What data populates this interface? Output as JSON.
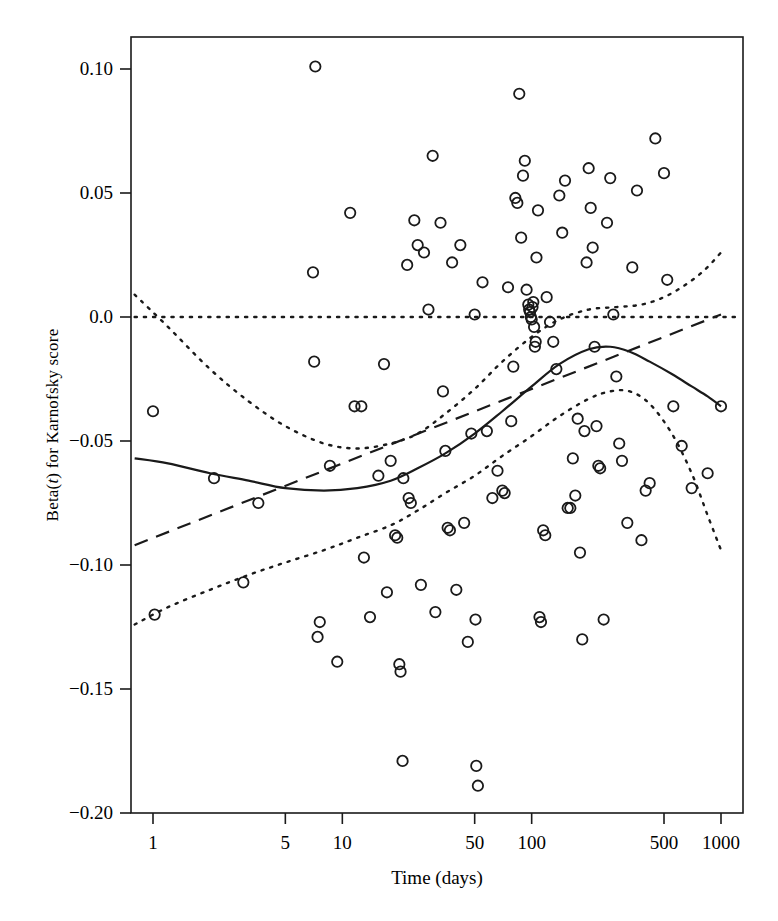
{
  "chart_data": {
    "type": "scatter",
    "title": "",
    "xlabel": "Time (days)",
    "ylabel": "Beta(t) for Karnofsky score",
    "ylabel_parts": {
      "pre": "Beta(",
      "italic": "t",
      "post": ") for Karnofsky score"
    },
    "x_scale": "log",
    "xlim": [
      0.76,
      1250
    ],
    "ylim": [
      -0.2,
      0.1135
    ],
    "xticks": [
      1,
      5,
      10,
      50,
      100,
      500,
      1000
    ],
    "xtick_labels": [
      "1",
      "5",
      "10",
      "50",
      "100",
      "500",
      "1000"
    ],
    "yticks": [
      0.1,
      0.05,
      0.0,
      -0.05,
      -0.1,
      -0.15,
      -0.2
    ],
    "ytick_labels": [
      "0.10",
      "0.05",
      "0.0",
      "-0.05",
      "-0.10",
      "-0.15",
      "-0.20"
    ],
    "grid": false,
    "legend": null,
    "frame": true,
    "marker": "open-circle",
    "marker_color": "#1a1a1a",
    "points": [
      [
        1.0,
        -0.038
      ],
      [
        1.02,
        -0.12
      ],
      [
        2.1,
        -0.065
      ],
      [
        3.0,
        -0.107
      ],
      [
        3.6,
        -0.075
      ],
      [
        7.2,
        0.101
      ],
      [
        7.0,
        0.018
      ],
      [
        7.1,
        -0.018
      ],
      [
        7.4,
        -0.129
      ],
      [
        7.6,
        -0.123
      ],
      [
        8.6,
        -0.06
      ],
      [
        9.4,
        -0.139
      ],
      [
        11.0,
        0.042
      ],
      [
        11.6,
        -0.036
      ],
      [
        12.6,
        -0.036
      ],
      [
        13.0,
        -0.097
      ],
      [
        14.0,
        -0.121
      ],
      [
        15.5,
        -0.064
      ],
      [
        16.6,
        -0.019
      ],
      [
        17.2,
        -0.111
      ],
      [
        18.0,
        -0.058
      ],
      [
        19.0,
        -0.088
      ],
      [
        19.5,
        -0.089
      ],
      [
        20.0,
        -0.14
      ],
      [
        20.3,
        -0.143
      ],
      [
        20.8,
        -0.179
      ],
      [
        21.0,
        -0.065
      ],
      [
        22.0,
        0.021
      ],
      [
        22.4,
        -0.073
      ],
      [
        23.0,
        -0.075
      ],
      [
        24.0,
        0.039
      ],
      [
        25.0,
        0.029
      ],
      [
        26.0,
        -0.108
      ],
      [
        27.0,
        0.026
      ],
      [
        28.5,
        0.003
      ],
      [
        30.0,
        0.065
      ],
      [
        31.0,
        -0.119
      ],
      [
        33.0,
        0.038
      ],
      [
        34.0,
        -0.03
      ],
      [
        35.0,
        -0.054
      ],
      [
        36.0,
        -0.085
      ],
      [
        37.0,
        -0.086
      ],
      [
        38.0,
        0.022
      ],
      [
        40.0,
        -0.11
      ],
      [
        42.0,
        0.029
      ],
      [
        44.0,
        -0.083
      ],
      [
        46.0,
        -0.131
      ],
      [
        48.0,
        -0.047
      ],
      [
        50.0,
        0.001
      ],
      [
        50.5,
        -0.122
      ],
      [
        51.0,
        -0.181
      ],
      [
        52.0,
        -0.189
      ],
      [
        55.0,
        0.014
      ],
      [
        58.0,
        -0.046
      ],
      [
        62.0,
        -0.073
      ],
      [
        66.0,
        -0.062
      ],
      [
        70.0,
        -0.07
      ],
      [
        72.0,
        -0.071
      ],
      [
        75.0,
        0.012
      ],
      [
        78.0,
        -0.042
      ],
      [
        80.0,
        -0.02
      ],
      [
        82.0,
        0.048
      ],
      [
        84.0,
        0.046
      ],
      [
        86.0,
        0.09
      ],
      [
        88.0,
        0.032
      ],
      [
        90.0,
        0.057
      ],
      [
        92.0,
        0.063
      ],
      [
        94.0,
        0.011
      ],
      [
        96.0,
        0.005
      ],
      [
        97.0,
        0.003
      ],
      [
        98.0,
        0.002
      ],
      [
        99.0,
        0.0
      ],
      [
        100.0,
        -0.001
      ],
      [
        101.0,
        0.004
      ],
      [
        102.0,
        0.006
      ],
      [
        103.0,
        -0.004
      ],
      [
        104.0,
        -0.012
      ],
      [
        105.0,
        -0.01
      ],
      [
        106.0,
        0.024
      ],
      [
        108.0,
        0.043
      ],
      [
        110.0,
        -0.121
      ],
      [
        112.0,
        -0.123
      ],
      [
        115.0,
        -0.086
      ],
      [
        118.0,
        -0.088
      ],
      [
        120.0,
        0.008
      ],
      [
        125.0,
        -0.002
      ],
      [
        130.0,
        -0.01
      ],
      [
        135.0,
        -0.021
      ],
      [
        140.0,
        0.049
      ],
      [
        145.0,
        0.034
      ],
      [
        150.0,
        0.055
      ],
      [
        155.0,
        -0.077
      ],
      [
        160.0,
        -0.077
      ],
      [
        165.0,
        -0.057
      ],
      [
        170.0,
        -0.072
      ],
      [
        175.0,
        -0.041
      ],
      [
        180.0,
        -0.095
      ],
      [
        185.0,
        -0.13
      ],
      [
        190.0,
        -0.046
      ],
      [
        195.0,
        0.022
      ],
      [
        200.0,
        0.06
      ],
      [
        205.0,
        0.044
      ],
      [
        210.0,
        0.028
      ],
      [
        215.0,
        -0.012
      ],
      [
        220.0,
        -0.044
      ],
      [
        225.0,
        -0.06
      ],
      [
        230.0,
        -0.061
      ],
      [
        240.0,
        -0.122
      ],
      [
        250.0,
        0.038
      ],
      [
        260.0,
        0.056
      ],
      [
        270.0,
        0.001
      ],
      [
        280.0,
        -0.024
      ],
      [
        290.0,
        -0.051
      ],
      [
        300.0,
        -0.058
      ],
      [
        320.0,
        -0.083
      ],
      [
        340.0,
        0.02
      ],
      [
        360.0,
        0.051
      ],
      [
        380.0,
        -0.09
      ],
      [
        400.0,
        -0.07
      ],
      [
        420.0,
        -0.067
      ],
      [
        450.0,
        0.072
      ],
      [
        500.0,
        0.058
      ],
      [
        520.0,
        0.015
      ],
      [
        560.0,
        -0.036
      ],
      [
        620.0,
        -0.052
      ],
      [
        700.0,
        -0.069
      ],
      [
        850.0,
        -0.063
      ],
      [
        1000.0,
        -0.036
      ]
    ],
    "curves": [
      {
        "name": "smooth-fit",
        "style": "solid",
        "points": [
          [
            0.8,
            -0.057
          ],
          [
            1.2,
            -0.059
          ],
          [
            2.0,
            -0.063
          ],
          [
            3.2,
            -0.066
          ],
          [
            5.0,
            -0.069
          ],
          [
            8.0,
            -0.07
          ],
          [
            12.0,
            -0.069
          ],
          [
            18.0,
            -0.066
          ],
          [
            25.0,
            -0.061
          ],
          [
            35.0,
            -0.055
          ],
          [
            50.0,
            -0.047
          ],
          [
            70.0,
            -0.038
          ],
          [
            100.0,
            -0.028
          ],
          [
            140.0,
            -0.019
          ],
          [
            200.0,
            -0.013
          ],
          [
            260.0,
            -0.012
          ],
          [
            330.0,
            -0.014
          ],
          [
            420.0,
            -0.018
          ],
          [
            550.0,
            -0.023
          ],
          [
            700.0,
            -0.028
          ],
          [
            850.0,
            -0.032
          ],
          [
            1000.0,
            -0.036
          ]
        ]
      },
      {
        "name": "linear-fit",
        "style": "dashed",
        "points": [
          [
            0.8,
            -0.092
          ],
          [
            1000.0,
            0.001
          ]
        ]
      },
      {
        "name": "upper-confidence-band",
        "style": "dotted",
        "points": [
          [
            0.8,
            0.009
          ],
          [
            1.2,
            -0.004
          ],
          [
            2.0,
            -0.021
          ],
          [
            3.2,
            -0.034
          ],
          [
            5.0,
            -0.044
          ],
          [
            8.0,
            -0.051
          ],
          [
            12.0,
            -0.053
          ],
          [
            18.0,
            -0.051
          ],
          [
            25.0,
            -0.047
          ],
          [
            35.0,
            -0.039
          ],
          [
            50.0,
            -0.029
          ],
          [
            70.0,
            -0.018
          ],
          [
            100.0,
            -0.008
          ],
          [
            140.0,
            -0.001
          ],
          [
            200.0,
            0.003
          ],
          [
            280.0,
            0.004
          ],
          [
            380.0,
            0.005
          ],
          [
            500.0,
            0.008
          ],
          [
            650.0,
            0.013
          ],
          [
            820.0,
            0.019
          ],
          [
            1000.0,
            0.026
          ]
        ]
      },
      {
        "name": "lower-confidence-band",
        "style": "dotted",
        "points": [
          [
            0.8,
            -0.124
          ],
          [
            1.2,
            -0.117
          ],
          [
            2.0,
            -0.11
          ],
          [
            3.2,
            -0.104
          ],
          [
            5.0,
            -0.099
          ],
          [
            8.0,
            -0.094
          ],
          [
            12.0,
            -0.089
          ],
          [
            18.0,
            -0.084
          ],
          [
            25.0,
            -0.078
          ],
          [
            35.0,
            -0.071
          ],
          [
            50.0,
            -0.064
          ],
          [
            70.0,
            -0.056
          ],
          [
            100.0,
            -0.048
          ],
          [
            140.0,
            -0.04
          ],
          [
            200.0,
            -0.033
          ],
          [
            260.0,
            -0.03
          ],
          [
            330.0,
            -0.03
          ],
          [
            420.0,
            -0.035
          ],
          [
            550.0,
            -0.047
          ],
          [
            700.0,
            -0.063
          ],
          [
            850.0,
            -0.08
          ],
          [
            1000.0,
            -0.094
          ]
        ]
      },
      {
        "name": "zero-reference-line",
        "style": "dotted",
        "points": [
          [
            0.8,
            0.0
          ],
          [
            1250.0,
            0.0
          ]
        ]
      }
    ]
  }
}
